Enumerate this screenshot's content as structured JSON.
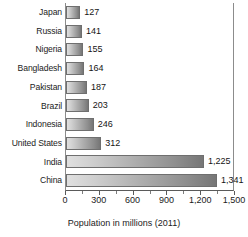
{
  "chart_data": {
    "type": "bar",
    "orientation": "horizontal",
    "title": "",
    "xlabel": "Population in millions (2011)",
    "ylabel": "",
    "xlim": [
      0,
      1500
    ],
    "grid": false,
    "legend": false,
    "categories": [
      "Japan",
      "Russia",
      "Nigeria",
      "Bangladesh",
      "Pakistan",
      "Brazil",
      "Indonesia",
      "United States",
      "India",
      "China"
    ],
    "values": [
      127,
      141,
      155,
      164,
      187,
      203,
      246,
      312,
      1225,
      1341
    ],
    "value_labels": [
      "127",
      "141",
      "155",
      "164",
      "187",
      "203",
      "246",
      "312",
      "1,225",
      "1,341"
    ],
    "xticks": [
      0,
      300,
      600,
      900,
      1200,
      1500
    ],
    "xtick_labels": [
      "0",
      "300",
      "600",
      "900",
      "1,200",
      "1,500"
    ],
    "xtick_minor": [
      150,
      450,
      750,
      1050,
      1350
    ],
    "bar_color_start": "#e0e0e0",
    "bar_color_end": "#767676",
    "bar_border_color": "#6f6f6f",
    "axis_color": "#5a5a5a",
    "text_color": "#1b1b1b",
    "background": "#ffffff"
  }
}
